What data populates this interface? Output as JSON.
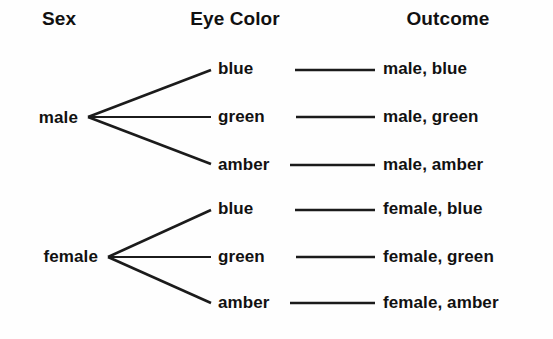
{
  "diagram": {
    "type": "tree-diagram",
    "title": "",
    "background_color": "#fefefe",
    "line_color": "#1b1b1b",
    "text_color": "#111111",
    "headers": [
      {
        "label": "Sex",
        "center_x": 59
      },
      {
        "label": "Eye Color",
        "center_x": 235
      },
      {
        "label": "Outcome",
        "center_x": 448
      }
    ],
    "branches": [
      {
        "root": "male",
        "root_x": 77,
        "root_y": 118,
        "vertex_x": 88,
        "vertex_y": 117,
        "children": [
          {
            "label": "blue",
            "x": 218,
            "y": 69,
            "outcome": "male, blue",
            "outcome_x": 383,
            "connector_from": 295,
            "connector_to": 375
          },
          {
            "label": "green",
            "x": 218,
            "y": 117,
            "outcome": "male, green",
            "outcome_x": 383,
            "connector_from": 295,
            "connector_to": 375
          },
          {
            "label": "amber",
            "x": 218,
            "y": 165,
            "outcome": "male, amber",
            "outcome_x": 383,
            "connector_from": 290,
            "connector_to": 375
          }
        ]
      },
      {
        "root": "female",
        "root_x": 97,
        "root_y": 257,
        "vertex_x": 108,
        "vertex_y": 257,
        "children": [
          {
            "label": "blue",
            "x": 218,
            "y": 209,
            "outcome": "female, blue",
            "outcome_x": 383,
            "connector_from": 295,
            "connector_to": 375
          },
          {
            "label": "green",
            "x": 218,
            "y": 257,
            "outcome": "female, green",
            "outcome_x": 383,
            "connector_from": 295,
            "connector_to": 375
          },
          {
            "label": "amber",
            "x": 218,
            "y": 303,
            "outcome": "female, amber",
            "outcome_x": 383,
            "connector_from": 290,
            "connector_to": 375
          }
        ]
      }
    ]
  },
  "labels": {
    "header_sex": "Sex",
    "header_eye_color": "Eye Color",
    "header_outcome": "Outcome",
    "male": "male",
    "female": "female",
    "male_blue": "blue",
    "male_green": "green",
    "male_amber": "amber",
    "female_blue": "blue",
    "female_green": "green",
    "female_amber": "amber",
    "outcome_male_blue": "male, blue",
    "outcome_male_green": "male, green",
    "outcome_male_amber": "male, amber",
    "outcome_female_blue": "female, blue",
    "outcome_female_green": "female, green",
    "outcome_female_amber": "female, amber"
  }
}
